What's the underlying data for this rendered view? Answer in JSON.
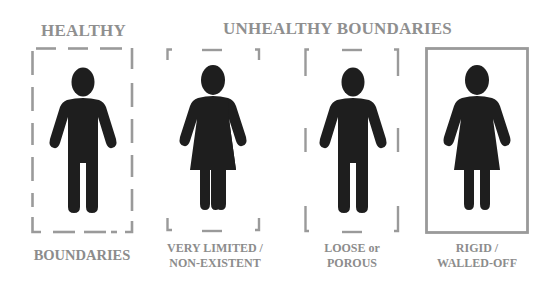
{
  "titles": {
    "healthy": "HEALTHY",
    "unhealthy": "UNHEALTHY BOUNDARIES"
  },
  "panels": [
    {
      "id": "healthy",
      "figure": "male",
      "border_style": "dashed",
      "caption_lines": [
        "BOUNDARIES"
      ]
    },
    {
      "id": "very-limited",
      "figure": "female",
      "border_style": "corners-only",
      "caption_lines": [
        "VERY LIMITED /",
        "NON-EXISTENT"
      ]
    },
    {
      "id": "loose",
      "figure": "male",
      "border_style": "sparse-dashed",
      "caption_lines": [
        "LOOSE or",
        "POROUS"
      ]
    },
    {
      "id": "rigid",
      "figure": "female",
      "border_style": "solid",
      "caption_lines": [
        "RIGID /",
        "WALLED-OFF"
      ]
    }
  ],
  "colors": {
    "text_gray": "#8f8f8f",
    "border_gray": "#9a9a9a",
    "figure": "#1e1e1e",
    "background": "#ffffff"
  }
}
